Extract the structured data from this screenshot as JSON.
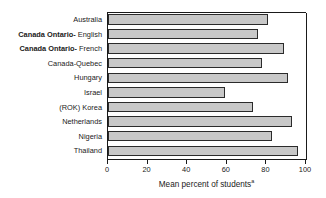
{
  "chart_data": {
    "type": "bar",
    "orientation": "horizontal",
    "title": "",
    "xlabel": "Mean percent of students",
    "xlabel_footnote": "a",
    "ylabel": "",
    "xlim": [
      0,
      100
    ],
    "xticks": [
      0,
      20,
      40,
      60,
      80,
      100
    ],
    "grid": false,
    "legend": false,
    "categories": [
      "Australia",
      "Canada Ontario- English",
      "Canada Ontario- French",
      "Canada-Quebec",
      "Hungary",
      "Israel",
      "(ROK) Korea",
      "Netherlands",
      "Nigeria",
      "Thailand"
    ],
    "category_parts": [
      {
        "bold_prefix": "",
        "rest": "Australia"
      },
      {
        "bold_prefix": "Canada Ontario-",
        "rest": "English"
      },
      {
        "bold_prefix": "Canada Ontario-",
        "rest": "French"
      },
      {
        "bold_prefix": "",
        "rest": "Canada-Quebec"
      },
      {
        "bold_prefix": "",
        "rest": "Hungary"
      },
      {
        "bold_prefix": "",
        "rest": "Israel"
      },
      {
        "bold_prefix": "",
        "rest": "(ROK) Korea"
      },
      {
        "bold_prefix": "",
        "rest": "Netherlands"
      },
      {
        "bold_prefix": "",
        "rest": "Nigeria"
      },
      {
        "bold_prefix": "",
        "rest": "Thailand"
      }
    ],
    "values": [
      81,
      76,
      89,
      78,
      91,
      59,
      73,
      93,
      83,
      96
    ],
    "bar_fill_color": "#c8c8c8",
    "bar_edge_color": "#2b2b2b",
    "axis_color": "#1a1a1a"
  },
  "xtick_labels": [
    "0",
    "20",
    "40",
    "60",
    "80",
    "100"
  ]
}
